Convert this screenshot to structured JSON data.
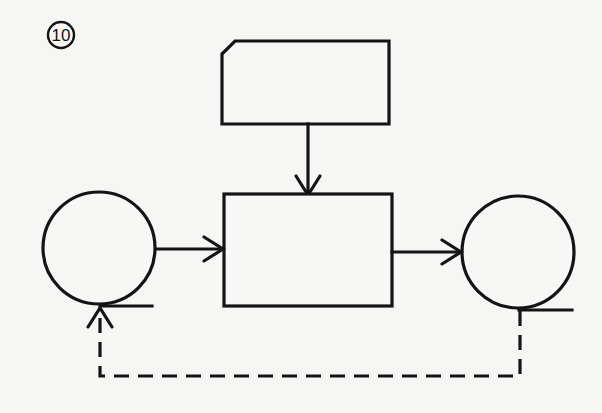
{
  "figure": {
    "label": "10",
    "background": "#f6f6f5",
    "stroke_color": "#141414"
  },
  "nodes": [
    {
      "id": "card-input",
      "shape": "punched-card",
      "label": ""
    },
    {
      "id": "process",
      "shape": "rectangle",
      "label": ""
    },
    {
      "id": "tape-input",
      "shape": "magnetic-tape",
      "label": ""
    },
    {
      "id": "tape-output",
      "shape": "magnetic-tape",
      "label": ""
    }
  ],
  "edges": [
    {
      "from": "card-input",
      "to": "process",
      "style": "solid",
      "arrow": true
    },
    {
      "from": "tape-input",
      "to": "process",
      "style": "solid",
      "arrow": true
    },
    {
      "from": "process",
      "to": "tape-output",
      "style": "solid",
      "arrow": true
    },
    {
      "from": "tape-output",
      "to": "tape-input",
      "style": "dashed",
      "arrow": true
    }
  ]
}
